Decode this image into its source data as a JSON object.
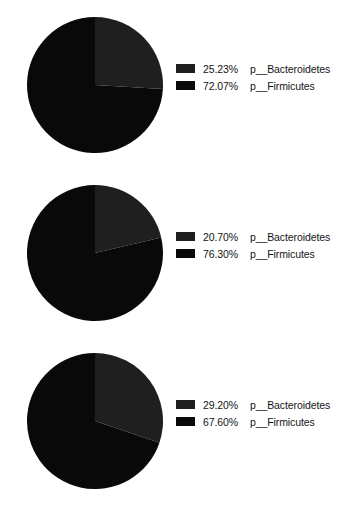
{
  "chart_data": [
    {
      "type": "pie",
      "title": "",
      "chart_index": 1,
      "legend_position": "right",
      "start_angle_deg": 0,
      "direction": "clockwise",
      "categories": [
        "p__Bacteroidetes",
        "p__Firmicutes"
      ],
      "values": [
        25.23,
        72.07
      ],
      "slices": [
        {
          "label": "p__Bacteroidetes",
          "percent": 25.23,
          "percent_text": "25.23%",
          "color": "#1f1f1f"
        },
        {
          "label": "p__Firmicutes",
          "percent": 72.07,
          "percent_text": "72.07%",
          "color": "#090909"
        }
      ]
    },
    {
      "type": "pie",
      "title": "",
      "chart_index": 2,
      "legend_position": "right",
      "start_angle_deg": 0,
      "direction": "clockwise",
      "categories": [
        "p__Bacteroidetes",
        "p__Firmicutes"
      ],
      "values": [
        20.7,
        76.3
      ],
      "slices": [
        {
          "label": "p__Bacteroidetes",
          "percent": 20.7,
          "percent_text": "20.70%",
          "color": "#1f1f1f"
        },
        {
          "label": "p__Firmicutes",
          "percent": 76.3,
          "percent_text": "76.30%",
          "color": "#090909"
        }
      ]
    },
    {
      "type": "pie",
      "title": "",
      "chart_index": 3,
      "legend_position": "right",
      "start_angle_deg": 0,
      "direction": "clockwise",
      "categories": [
        "p__Bacteroidetes",
        "p__Firmicutes"
      ],
      "values": [
        29.2,
        67.6
      ],
      "slices": [
        {
          "label": "p__Bacteroidetes",
          "percent": 29.2,
          "percent_text": "29.20%",
          "color": "#1f1f1f"
        },
        {
          "label": "p__Firmicutes",
          "percent": 67.6,
          "percent_text": "67.60%",
          "color": "#090909"
        }
      ]
    }
  ],
  "background_color": "#ffffff",
  "text_color": "#141414"
}
